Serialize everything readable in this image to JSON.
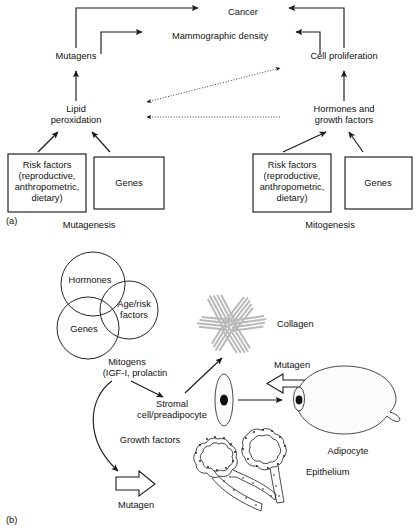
{
  "figure": {
    "background_color": "#ffffff",
    "line_color": "#1a1a1a",
    "fibril_color": "#b9b9b9"
  },
  "panel_a": {
    "id": "(a)",
    "nodes": {
      "cancer": "Cancer",
      "mammographic_density": "Mammographic density",
      "mutagens": "Mutagens",
      "cell_proliferation": "Cell proliferation",
      "lipid_peroxidation_line1": "Lipid",
      "lipid_peroxidation_line2": "peroxidation",
      "hormones_line1": "Hormones and",
      "hormones_line2": "growth factors"
    },
    "boxes": [
      {
        "name": "risk-factors-left",
        "lines": [
          "Risk factors",
          "(reproductive,",
          "anthropometric,",
          "dietary)"
        ]
      },
      {
        "name": "genes-left",
        "lines": [
          "Genes"
        ]
      },
      {
        "name": "risk-factors-right",
        "lines": [
          "Risk factors",
          "(reproductive,",
          "anthropometric,",
          "dietary)"
        ]
      },
      {
        "name": "genes-right",
        "lines": [
          "Genes"
        ]
      }
    ],
    "captions": {
      "left": "Mutagenesis",
      "right": "Mitogenesis"
    }
  },
  "panel_b": {
    "id": "(b)",
    "circles": [
      {
        "name": "hormones",
        "label": "Hormones"
      },
      {
        "name": "age-risk-factors",
        "label_line1": "Age/risk",
        "label_line2": "factors"
      },
      {
        "name": "genes",
        "label": "Genes"
      }
    ],
    "labels": {
      "mitogens_line1": "Mitogens",
      "mitogens_line2": "(IGF-I, prolactin",
      "stromal_line1": "Stromal",
      "stromal_line2": "cell/preadipocyte",
      "growth_factors": "Growth factors",
      "collagen": "Collagen",
      "adipocyte": "Adipocyte",
      "epithelium": "Epithelium",
      "mutagen_upper": "Mutagen",
      "mutagen_lower": "Mutagen"
    }
  }
}
